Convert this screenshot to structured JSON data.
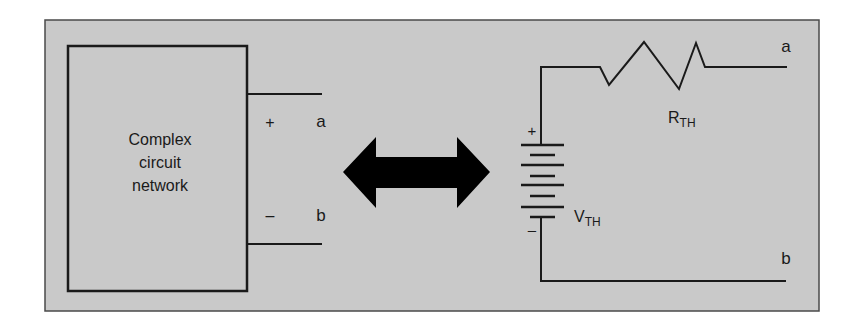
{
  "colors": {
    "background": "#ffffff",
    "panel_fill": "#c9c9c9",
    "stroke": "#1a1a1a",
    "arrow": "#000000"
  },
  "left_circuit": {
    "box_label_lines": [
      "Complex",
      "circuit",
      "network"
    ],
    "terminal_a": "a",
    "terminal_b": "b",
    "plus_sign": "+",
    "minus_sign": "–"
  },
  "equivalence_arrow": {
    "icon": "double-headed-arrow-icon"
  },
  "right_circuit": {
    "resistor_label": "R",
    "resistor_subscript": "TH",
    "source_label": "V",
    "source_subscript": "TH",
    "terminal_a": "a",
    "terminal_b": "b",
    "plus_sign": "+",
    "minus_sign": "–"
  }
}
